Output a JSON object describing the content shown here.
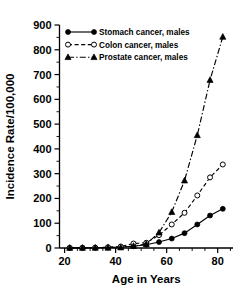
{
  "chart_data": {
    "type": "line",
    "title": "",
    "xlabel": "Age in Years",
    "ylabel": "Incidence Rate/100,000",
    "xlim": [
      18,
      86
    ],
    "ylim": [
      0,
      900
    ],
    "xticks": [
      20,
      40,
      60,
      80
    ],
    "xtick_labels": [
      "20",
      "40",
      "60",
      "80"
    ],
    "xticks_minor": [
      25,
      30,
      35,
      45,
      50,
      55,
      65,
      70,
      75,
      85
    ],
    "yticks": [
      0,
      100,
      200,
      300,
      400,
      500,
      600,
      700,
      800,
      900
    ],
    "ytick_labels": [
      "0",
      "100",
      "200",
      "300",
      "400",
      "500",
      "600",
      "700",
      "800",
      "900"
    ],
    "yticks_minor": [
      50,
      150,
      250,
      350,
      450,
      550,
      650,
      750,
      850
    ],
    "grid": false,
    "legend_position": "top-left",
    "x": [
      22,
      27,
      32,
      37,
      42,
      47,
      52,
      57,
      62,
      67,
      72,
      77,
      82
    ],
    "series": [
      {
        "name": "Stomach cancer, males",
        "marker": "filled-circle",
        "linestyle": "solid",
        "color": "#000000",
        "values": [
          0.4,
          0.6,
          1.0,
          2.0,
          4.0,
          7.0,
          13.0,
          24.0,
          38.0,
          60.0,
          95.0,
          131.0,
          158.0
        ]
      },
      {
        "name": "Colon cancer, males",
        "marker": "open-circle",
        "linestyle": "dashed",
        "color": "#000000",
        "values": [
          0.5,
          0.8,
          1.5,
          3.0,
          6.0,
          18.0,
          21.0,
          52.0,
          95.0,
          142.0,
          212.0,
          285.0,
          337.0
        ]
      },
      {
        "name": "Prostate cancer, males",
        "marker": "filled-triangle",
        "linestyle": "dashdot",
        "color": "#000000",
        "values": [
          0.2,
          0.3,
          0.5,
          0.8,
          2.0,
          8.0,
          16.0,
          62.0,
          145.0,
          272.0,
          455.0,
          678.0,
          852.0
        ]
      }
    ]
  }
}
